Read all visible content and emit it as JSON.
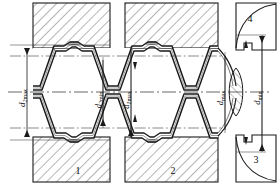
{
  "drawing": {
    "title": "Threaded joint cross-section with trapezoidal thread profile",
    "type": "engineering-section-drawing",
    "centerline_y": 92,
    "colors": {
      "line": "#1a1a1a",
      "hatch": "#555555",
      "thin": "#3a3a3a",
      "background": "#ffffff"
    },
    "dimensions": [
      {
        "id": "d2max",
        "base": "d",
        "sub": "2",
        "suffix": "max",
        "x": 27,
        "y_top": 45,
        "y_bottom": 140,
        "arrow_top": true,
        "arrow_bottom": true
      },
      {
        "id": "d2min",
        "base": "d",
        "sub": "2",
        "suffix": "min",
        "x": 103,
        "y_top": 57,
        "y_bottom": 128,
        "arrow_top": false,
        "arrow_bottom": true
      },
      {
        "id": "d1max",
        "base": "d",
        "sub": "1",
        "suffix": "max",
        "x": 131,
        "y_top": 46,
        "y_bottom": 139,
        "arrow_top": false,
        "arrow_bottom": true
      },
      {
        "id": "dmax",
        "base": "d",
        "sub": "",
        "suffix": "max",
        "x": 225,
        "y_top": 52,
        "y_bottom": 133,
        "arrow_top": false,
        "arrow_bottom": false
      },
      {
        "id": "dmin",
        "base": "d",
        "sub": "",
        "suffix": "min",
        "x": 262,
        "y_top": 35,
        "y_bottom": 152,
        "arrow_top": true,
        "arrow_bottom": true
      }
    ],
    "callouts": [
      {
        "id": "part-1",
        "label": "1",
        "x": 78,
        "y": 170
      },
      {
        "id": "part-2",
        "label": "2",
        "x": 173,
        "y": 170
      },
      {
        "id": "part-3",
        "label": "3",
        "x": 256,
        "y": 160
      },
      {
        "id": "part-4",
        "label": "4",
        "x": 250,
        "y": 19
      }
    ],
    "blocks": [
      {
        "id": "block-upper-left",
        "x": 33,
        "y": 3,
        "w": 77,
        "h": 45
      },
      {
        "id": "block-upper-right",
        "x": 125,
        "y": 3,
        "w": 93,
        "h": 45
      },
      {
        "id": "block-lower-left",
        "x": 33,
        "y": 137,
        "w": 77,
        "h": 45
      },
      {
        "id": "block-lower-right",
        "x": 125,
        "y": 137,
        "w": 93,
        "h": 45
      }
    ],
    "thread": {
      "profile": "trapezoidal",
      "pitch": 46,
      "crest_y_upper": 42,
      "root_y_upper": 66,
      "teeth_count": 5
    }
  }
}
